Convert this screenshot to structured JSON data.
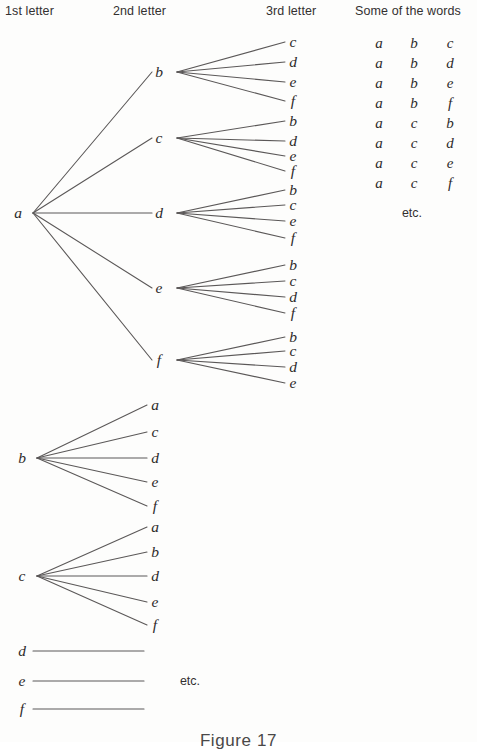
{
  "figure": {
    "caption": "Figure 17",
    "caption_y": 731
  },
  "headers": [
    {
      "label": "1st letter",
      "x": 5,
      "y": 4
    },
    {
      "label": "2nd letter",
      "x": 113,
      "y": 4
    },
    {
      "label": "3rd letter",
      "x": 266,
      "y": 4
    },
    {
      "label": "Some of the words",
      "x": 355,
      "y": 4
    }
  ],
  "tree": {
    "line_color": "#5b5858",
    "line_width": 1.1,
    "level1": [
      {
        "label": "a",
        "x": 18,
        "y": 213,
        "fan_x": 33,
        "fan_y": 213
      },
      {
        "label": "b",
        "x": 22,
        "y": 458,
        "fan_x": 37,
        "fan_y": 458
      },
      {
        "label": "c",
        "x": 22,
        "y": 576,
        "fan_x": 37,
        "fan_y": 576
      },
      {
        "label": "d",
        "x": 22,
        "y": 651,
        "fan_x": 37,
        "fan_y": 651
      },
      {
        "label": "e",
        "x": 22,
        "y": 681,
        "fan_x": 37,
        "fan_y": 681
      },
      {
        "label": "f",
        "x": 22,
        "y": 709,
        "fan_x": 37,
        "fan_y": 709
      }
    ],
    "level2": [
      {
        "label": "b",
        "x": 159,
        "y": 72,
        "fan_x": 177,
        "parent": 0
      },
      {
        "label": "c",
        "x": 159,
        "y": 138,
        "fan_x": 177,
        "parent": 0
      },
      {
        "label": "d",
        "x": 159,
        "y": 213,
        "fan_x": 177,
        "parent": 0
      },
      {
        "label": "e",
        "x": 159,
        "y": 288,
        "fan_x": 177,
        "parent": 0
      },
      {
        "label": "f",
        "x": 159,
        "y": 360,
        "fan_x": 177,
        "parent": 0
      }
    ],
    "level3": [
      {
        "label": "c",
        "x": 293,
        "y": 42,
        "parent": 0
      },
      {
        "label": "d",
        "x": 293,
        "y": 62,
        "parent": 0
      },
      {
        "label": "e",
        "x": 293,
        "y": 82,
        "parent": 0
      },
      {
        "label": "f",
        "x": 293,
        "y": 101,
        "parent": 0
      },
      {
        "label": "b",
        "x": 293,
        "y": 121,
        "parent": 1
      },
      {
        "label": "d",
        "x": 293,
        "y": 141,
        "parent": 1
      },
      {
        "label": "e",
        "x": 293,
        "y": 156,
        "parent": 1
      },
      {
        "label": "f",
        "x": 293,
        "y": 171,
        "parent": 1
      },
      {
        "label": "b",
        "x": 293,
        "y": 190,
        "parent": 2
      },
      {
        "label": "c",
        "x": 293,
        "y": 205,
        "parent": 2
      },
      {
        "label": "e",
        "x": 293,
        "y": 221,
        "parent": 2
      },
      {
        "label": "f",
        "x": 293,
        "y": 238,
        "parent": 2
      },
      {
        "label": "b",
        "x": 293,
        "y": 265,
        "parent": 3
      },
      {
        "label": "c",
        "x": 293,
        "y": 281,
        "parent": 3
      },
      {
        "label": "d",
        "x": 293,
        "y": 297,
        "parent": 3
      },
      {
        "label": "f",
        "x": 293,
        "y": 313,
        "parent": 3
      },
      {
        "label": "b",
        "x": 293,
        "y": 337,
        "parent": 4
      },
      {
        "label": "c",
        "x": 293,
        "y": 351,
        "parent": 4
      },
      {
        "label": "d",
        "x": 293,
        "y": 367,
        "parent": 4
      },
      {
        "label": "e",
        "x": 293,
        "y": 383,
        "parent": 4
      }
    ],
    "b_branch": [
      {
        "label": "a",
        "x": 155,
        "y": 405,
        "parent": 1
      },
      {
        "label": "c",
        "x": 155,
        "y": 432,
        "parent": 1
      },
      {
        "label": "d",
        "x": 155,
        "y": 458,
        "parent": 1
      },
      {
        "label": "e",
        "x": 155,
        "y": 482,
        "parent": 1
      },
      {
        "label": "f",
        "x": 155,
        "y": 506,
        "parent": 1
      }
    ],
    "c_branch": [
      {
        "label": "a",
        "x": 155,
        "y": 527,
        "parent": 2
      },
      {
        "label": "b",
        "x": 155,
        "y": 552,
        "parent": 2
      },
      {
        "label": "d",
        "x": 155,
        "y": 576,
        "parent": 2
      },
      {
        "label": "e",
        "x": 155,
        "y": 602,
        "parent": 2
      },
      {
        "label": "f",
        "x": 155,
        "y": 625,
        "parent": 2
      }
    ],
    "stub_lines": [
      {
        "x1": 33,
        "y1": 651,
        "x2": 144,
        "y2": 651
      },
      {
        "x1": 33,
        "y1": 681,
        "x2": 144,
        "y2": 681
      },
      {
        "x1": 33,
        "y1": 709,
        "x2": 144,
        "y2": 709
      }
    ]
  },
  "words": {
    "col_x": [
      379,
      414,
      450
    ],
    "rows": [
      {
        "y": 43,
        "letters": [
          "a",
          "b",
          "c"
        ]
      },
      {
        "y": 63,
        "letters": [
          "a",
          "b",
          "d"
        ]
      },
      {
        "y": 83,
        "letters": [
          "a",
          "b",
          "e"
        ]
      },
      {
        "y": 103,
        "letters": [
          "a",
          "b",
          "f"
        ]
      },
      {
        "y": 123,
        "letters": [
          "a",
          "c",
          "b"
        ]
      },
      {
        "y": 143,
        "letters": [
          "a",
          "c",
          "d"
        ]
      },
      {
        "y": 163,
        "letters": [
          "a",
          "c",
          "e"
        ]
      },
      {
        "y": 183,
        "letters": [
          "a",
          "c",
          "f"
        ]
      }
    ],
    "etc": {
      "label": "etc.",
      "x": 412,
      "y": 213
    }
  },
  "diagram_etc": {
    "label": "etc.",
    "x": 190,
    "y": 681
  }
}
